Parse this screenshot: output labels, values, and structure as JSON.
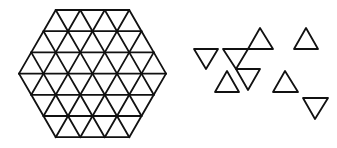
{
  "figure": {
    "stroke_color": "#111111",
    "background": "#ffffff",
    "hexagon": {
      "side_in_triangles": 3,
      "rows": 6,
      "top_y": 10,
      "row_height": 21.2,
      "tri_side": 24.5,
      "center_x": 92.5
    },
    "pieces": [
      {
        "orientation": "down",
        "points": [
          [
            194,
            49
          ],
          [
            218,
            49
          ],
          [
            206,
            69
          ]
        ]
      },
      {
        "orientation": "down",
        "points": [
          [
            223,
            49
          ],
          [
            248,
            49
          ],
          [
            236,
            69
          ]
        ]
      },
      {
        "orientation": "up",
        "points": [
          [
            260,
            28
          ],
          [
            248,
            49
          ],
          [
            273,
            49
          ]
        ]
      },
      {
        "orientation": "up",
        "points": [
          [
            306,
            28
          ],
          [
            294,
            49
          ],
          [
            318,
            49
          ]
        ]
      },
      {
        "orientation": "up",
        "points": [
          [
            227,
            71
          ],
          [
            215,
            92
          ],
          [
            239,
            92
          ]
        ]
      },
      {
        "orientation": "down",
        "points": [
          [
            236,
            69
          ],
          [
            260,
            69
          ],
          [
            248,
            90
          ]
        ]
      },
      {
        "orientation": "up",
        "points": [
          [
            285,
            71
          ],
          [
            273,
            92
          ],
          [
            298,
            92
          ]
        ]
      },
      {
        "orientation": "down",
        "points": [
          [
            303,
            98
          ],
          [
            328,
            98
          ],
          [
            315,
            119
          ]
        ]
      }
    ]
  }
}
